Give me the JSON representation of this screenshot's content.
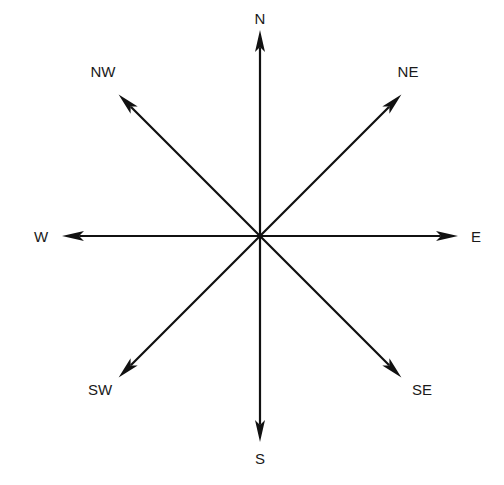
{
  "diagram": {
    "title": "",
    "type": "compass-rose",
    "color": "#111111",
    "directions": [
      {
        "key": "N",
        "label": "N",
        "angle_deg": 0
      },
      {
        "key": "NE",
        "label": "NE",
        "angle_deg": 45
      },
      {
        "key": "E",
        "label": "E",
        "angle_deg": 90
      },
      {
        "key": "SE",
        "label": "SE",
        "angle_deg": 135
      },
      {
        "key": "S",
        "label": "S",
        "angle_deg": 180
      },
      {
        "key": "SW",
        "label": "SW",
        "angle_deg": 225
      },
      {
        "key": "W",
        "label": "W",
        "angle_deg": 270
      },
      {
        "key": "NW",
        "label": "NW",
        "angle_deg": 315
      }
    ]
  }
}
